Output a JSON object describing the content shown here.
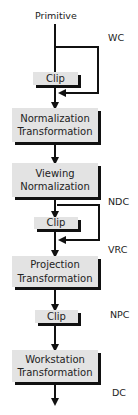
{
  "diagram": {
    "start_label": "Primitive",
    "stages": [
      {
        "id": "clip-1",
        "label": "Clip"
      },
      {
        "id": "normalization-transformation",
        "line1": "Normalization",
        "line2": "Transformation"
      },
      {
        "id": "viewing-normalization",
        "line1": "Viewing",
        "line2": "Normalization"
      },
      {
        "id": "clip-2",
        "label": "Clip"
      },
      {
        "id": "projection-transformation",
        "line1": "Projection",
        "line2": "Transformation"
      },
      {
        "id": "clip-3",
        "label": "Clip"
      },
      {
        "id": "workstation-transformation",
        "line1": "Workstation",
        "line2": "Transformation"
      }
    ],
    "coordinate_labels": {
      "wc": "WC",
      "ndc": "NDC",
      "vrc": "VRC",
      "npc": "NPC",
      "dc": "DC"
    },
    "colors": {
      "box_fill": "#e3e3e3",
      "line": "#111111",
      "text": "#222222"
    }
  }
}
